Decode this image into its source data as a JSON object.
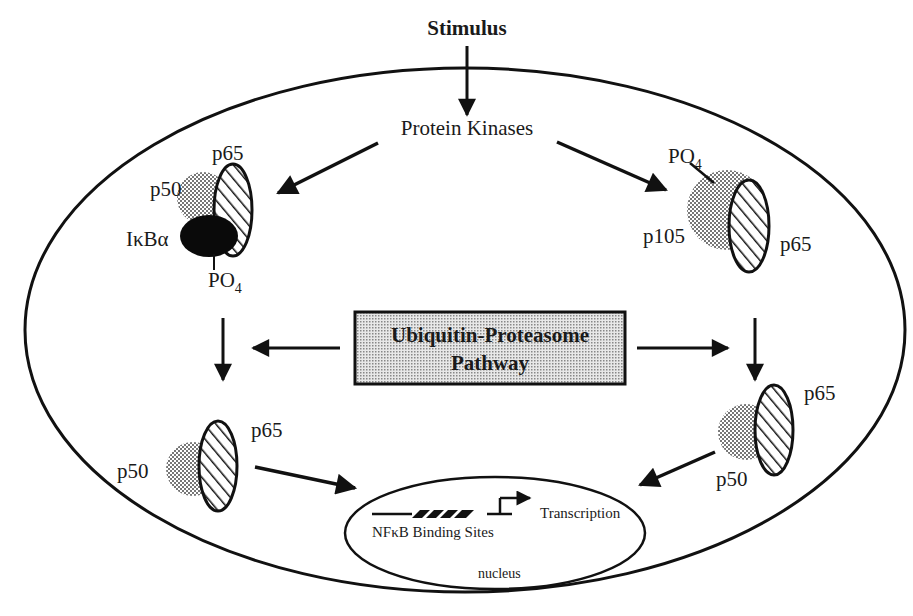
{
  "diagram": {
    "title": "Stimulus",
    "kinase_label": "Protein Kinases",
    "center_box": {
      "line1": "Ubiquitin-Proteasome",
      "line2": "Pathway"
    },
    "left_complex": {
      "p65": "p65",
      "p50": "p50",
      "ikba": "IκBα",
      "po4": "PO",
      "po4_sub": "4"
    },
    "right_complex": {
      "po4": "PO",
      "po4_sub": "4",
      "p105": "p105",
      "p65": "p65"
    },
    "left_dimer": {
      "p50": "p50",
      "p65": "p65"
    },
    "right_dimer": {
      "p65": "p65",
      "p50": "p50"
    },
    "nucleus": {
      "binding_sites": "NFκB Binding Sites",
      "transcription": "Transcription",
      "label": "nucleus"
    },
    "colors": {
      "line": "#111111",
      "dots": "#8a8a8a",
      "background": "#ffffff"
    }
  }
}
